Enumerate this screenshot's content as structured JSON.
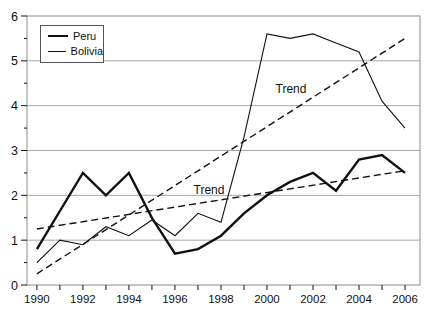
{
  "legend": {
    "items": [
      {
        "label": "Peru",
        "swatch": "thick-black-line"
      },
      {
        "label": "Bolivia",
        "swatch": "thin-black-line"
      }
    ]
  },
  "chart_data": {
    "type": "line",
    "title": "",
    "xlabel": "",
    "ylabel": "",
    "x": [
      1990,
      1991,
      1992,
      1993,
      1994,
      1995,
      1996,
      1997,
      1998,
      1999,
      2000,
      2001,
      2002,
      2003,
      2004,
      2005,
      2006
    ],
    "series": [
      {
        "name": "Peru",
        "style": "solid",
        "thickness": "thick",
        "values": [
          0.8,
          1.65,
          2.5,
          2.0,
          2.5,
          1.5,
          0.7,
          0.8,
          1.1,
          1.6,
          2.0,
          2.3,
          2.5,
          2.1,
          2.8,
          2.9,
          2.5
        ]
      },
      {
        "name": "Bolivia",
        "style": "solid",
        "thickness": "thin",
        "values": [
          0.5,
          1.0,
          0.9,
          1.3,
          1.1,
          1.45,
          1.1,
          1.6,
          1.4,
          3.3,
          5.6,
          5.5,
          5.6,
          5.4,
          5.2,
          4.1,
          3.5
        ]
      }
    ],
    "trends": [
      {
        "name": "bolivia-trend",
        "style": "dashed",
        "x": [
          1990,
          2006
        ],
        "values": [
          0.25,
          5.5
        ]
      },
      {
        "name": "peru-trend",
        "style": "dashed",
        "x": [
          1990,
          2006
        ],
        "values": [
          1.25,
          2.55
        ]
      }
    ],
    "annotations": [
      {
        "text": "Trend",
        "x": 2001.0,
        "y": 4.38,
        "for": "bolivia-trend"
      },
      {
        "text": "Trend",
        "x": 1997.45,
        "y": 2.11,
        "for": "peru-trend"
      }
    ],
    "ylim": [
      0,
      6
    ],
    "xlim": [
      1989.57,
      2006.65
    ],
    "yticks": [
      0,
      1,
      2,
      3,
      4,
      5,
      6
    ],
    "ytick_minor_step": 0.5,
    "xticks_every_year": true,
    "xtick_label_step": 2,
    "grid": "horizontal-major",
    "legend_position": "top-left-inside",
    "colors": {
      "line": "#111111",
      "grid": "#a6a6a6",
      "frame": "#8c8c8c",
      "text": "#111111",
      "background": "#ffffff"
    }
  }
}
